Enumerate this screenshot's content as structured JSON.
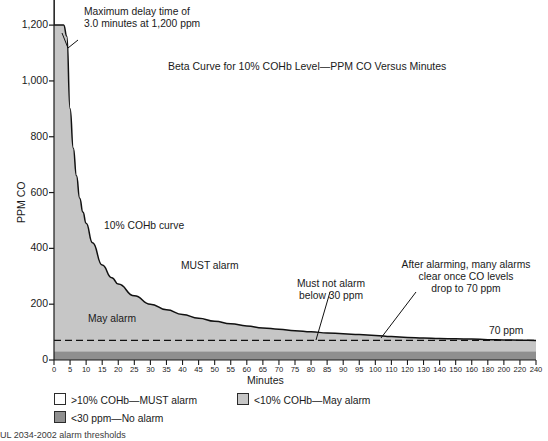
{
  "chart_data": {
    "type": "line",
    "title": "Beta Curve for 10% COHb Level—PPM CO Versus Minutes",
    "xlabel": "Minutes",
    "ylabel": "PPM CO",
    "ylim": [
      0,
      1290
    ],
    "xlim": [
      0,
      240
    ],
    "grid": false,
    "legend_position": "below-axes",
    "y_ticks": [
      "0",
      "200",
      "400",
      "600",
      "800",
      "1,000",
      "1,200"
    ],
    "y_tick_values": [
      0,
      200,
      400,
      600,
      800,
      1000,
      1200
    ],
    "x_ticks": [
      "0",
      "5",
      "10",
      "15",
      "20",
      "25",
      "30",
      "35",
      "40",
      "45",
      "50",
      "55",
      "60",
      "65",
      "70",
      "75",
      "80",
      "85",
      "90",
      "95",
      "100",
      "110",
      "120",
      "130",
      "140",
      "150",
      "160",
      "180",
      "200",
      "220",
      "240"
    ],
    "x_tick_values": [
      0,
      5,
      10,
      15,
      20,
      25,
      30,
      35,
      40,
      45,
      50,
      55,
      60,
      65,
      70,
      75,
      80,
      85,
      90,
      95,
      100,
      110,
      120,
      130,
      140,
      150,
      160,
      180,
      200,
      220,
      240
    ],
    "series": [
      {
        "name": "10% COHb curve",
        "x": [
          0,
          3,
          4,
          5,
          6,
          7,
          8,
          9,
          10,
          12,
          15,
          18,
          20,
          25,
          30,
          35,
          40,
          45,
          50,
          55,
          60,
          65,
          70,
          75,
          80,
          85,
          90,
          95,
          100,
          110,
          120,
          130,
          140,
          150,
          160,
          180,
          200,
          220,
          240
        ],
        "y": [
          1200,
          1200,
          1160,
          900,
          760,
          660,
          580,
          530,
          490,
          420,
          340,
          295,
          272,
          230,
          200,
          180,
          163,
          150,
          139,
          130,
          122,
          115,
          110,
          105,
          101,
          97,
          94,
          91,
          88,
          84,
          81,
          79,
          77,
          76,
          75,
          73,
          72,
          71,
          70
        ]
      }
    ],
    "reference_lines": [
      {
        "name": "70 ppm",
        "y": 70,
        "style": "dashed",
        "label": "70 ppm"
      }
    ],
    "bands": [
      {
        "name": "no-alarm-band",
        "y_from": 0,
        "y_to": 30,
        "color": "#8f8f8f"
      },
      {
        "name": "may-alarm-region",
        "description": "below curve",
        "color": "#c6c6c6"
      },
      {
        "name": "must-alarm-region",
        "description": "above curve",
        "color": "#ffffff"
      }
    ],
    "annotations": [
      {
        "name": "max-delay",
        "text_lines": [
          "Maximum delay time of",
          "3.0 minutes at 1,200 ppm"
        ],
        "points_to": {
          "x": 3,
          "y": 1200
        }
      },
      {
        "name": "curve-label",
        "text_lines": [
          "10% COHb curve"
        ]
      },
      {
        "name": "must-alarm",
        "text_lines": [
          "MUST alarm"
        ]
      },
      {
        "name": "may-alarm",
        "text_lines": [
          "May alarm"
        ]
      },
      {
        "name": "must-not-alarm",
        "text_lines": [
          "Must not alarm",
          "below 30 ppm"
        ],
        "points_to": {
          "x": 80,
          "y": 20
        }
      },
      {
        "name": "after-alarming",
        "text_lines": [
          "After alarming, many alarms",
          "clear once CO levels",
          "drop to 70 ppm"
        ],
        "points_to": {
          "x": 120,
          "y": 70
        }
      },
      {
        "name": "seventy-ppm",
        "text_lines": [
          "70 ppm"
        ]
      }
    ],
    "legend": [
      {
        "label": ">10% COHb—MUST alarm",
        "color": "#ffffff"
      },
      {
        "label": "<10% COHb—May alarm",
        "color": "#c6c6c6"
      },
      {
        "label": "<30 ppm—No alarm",
        "color": "#8f8f8f"
      }
    ]
  },
  "figure": {
    "title": "Beta Curve for 10% COHb Level—PPM CO Versus Minutes",
    "y_axis_label": "PPM CO",
    "x_axis_label": "Minutes",
    "caption": "UL 2034-2002 alarm thresholds"
  },
  "annotations": {
    "max_delay_line1": "Maximum delay time of",
    "max_delay_line2": "3.0 minutes at 1,200 ppm",
    "curve_label": "10% COHb curve",
    "must_alarm": "MUST alarm",
    "may_alarm": "May alarm",
    "must_not_alarm_line1": "Must not alarm",
    "must_not_alarm_line2": "below 30 ppm",
    "after_alarming_line1": "After alarming, many alarms",
    "after_alarming_line2": "clear once CO levels",
    "after_alarming_line3": "drop to 70 ppm",
    "seventy_ppm": "70 ppm"
  },
  "legend": {
    "item1": ">10% COHb—MUST alarm",
    "item2": "<10% COHb—May alarm",
    "item3": "<30 ppm—No alarm"
  },
  "colors": {
    "may_alarm_fill": "#c6c6c6",
    "no_alarm_band": "#8f8f8f",
    "must_alarm_fill": "#ffffff",
    "curve_stroke": "#111111",
    "axis": "#1a1a1a"
  }
}
